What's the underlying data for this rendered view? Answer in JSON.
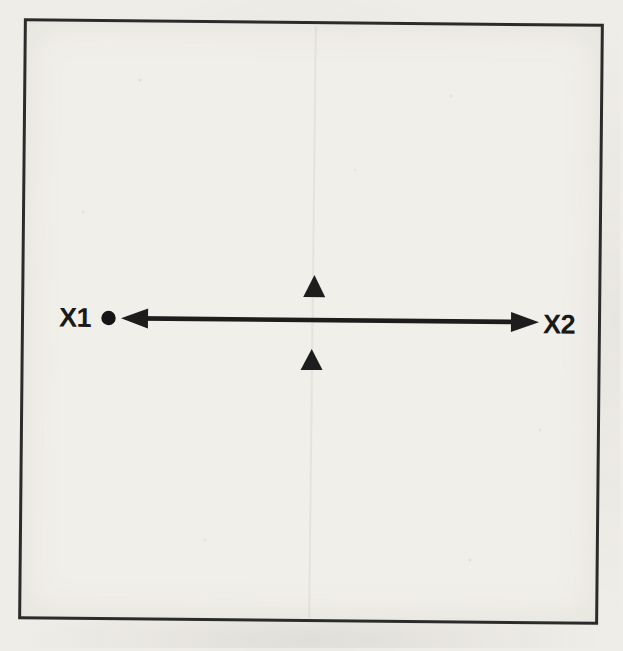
{
  "figure": {
    "labels": {
      "x1": "X1",
      "x2": "X2"
    },
    "markers": {
      "axis_line": "double-headed-horizontal-arrow",
      "endpoint_dot": "filled-circle",
      "upper_marker": "filled-triangle-up",
      "lower_marker": "filled-triangle-up",
      "border": "square-frame"
    },
    "colors": {
      "ink": "#1d1d1d",
      "frame": "#2b2b2b",
      "paper": "#efede7"
    }
  }
}
